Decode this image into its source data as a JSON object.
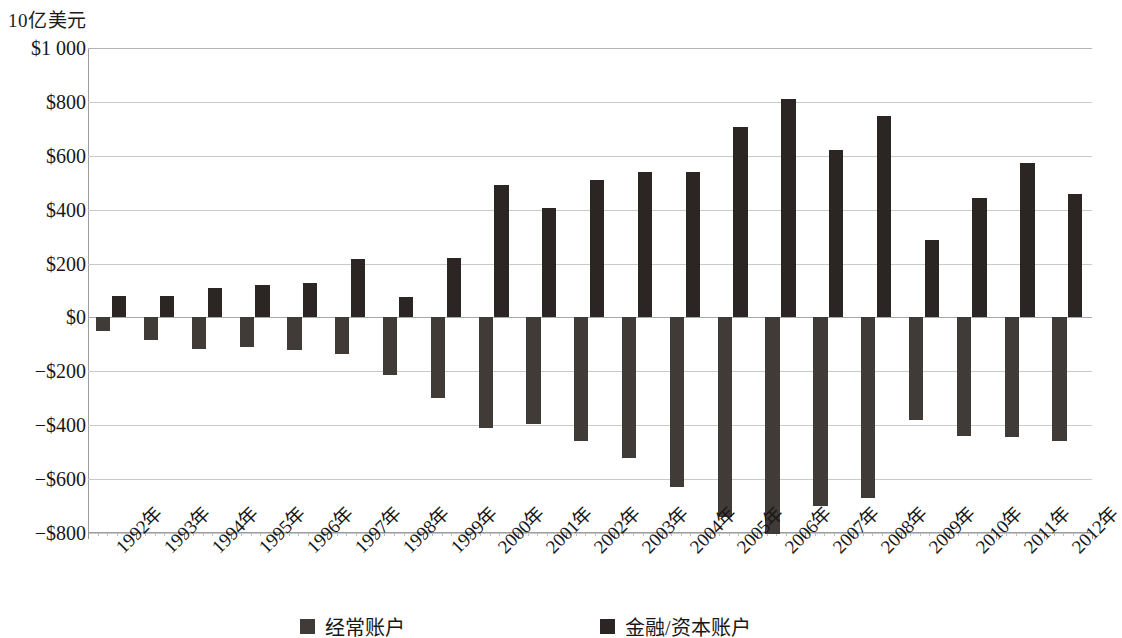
{
  "unit_caption": "10亿美元",
  "legend": {
    "position": "bottom",
    "entries": [
      {
        "label": "经常账户",
        "color": "#413b37",
        "key": "ca"
      },
      {
        "label": "金融/资本账户",
        "color": "#2b2623",
        "key": "fa"
      }
    ]
  },
  "axis": {
    "y_tick_labels": [
      "$1 000",
      "$800",
      "$600",
      "$400",
      "$200",
      "$0",
      "−$200",
      "−$400",
      "−$600",
      "−$800"
    ],
    "y_tick_values": [
      1000,
      800,
      600,
      400,
      200,
      0,
      -200,
      -400,
      -600,
      -800
    ]
  },
  "chart_data": {
    "type": "bar",
    "title": "",
    "subtitle": "",
    "xlabel": "",
    "ylabel": "10亿美元",
    "ylim": [
      -800,
      1000
    ],
    "ytick_step": 200,
    "grid": true,
    "legend_position": "bottom",
    "categories": [
      "1992年",
      "1993年",
      "1994年",
      "1995年",
      "1996年",
      "1997年",
      "1998年",
      "1999年",
      "2000年",
      "2001年",
      "2002年",
      "2003年",
      "2004年",
      "2005年",
      "2006年",
      "2007年",
      "2008年",
      "2009年",
      "2010年",
      "2011年",
      "2012年"
    ],
    "series": [
      {
        "name": "经常账户",
        "color": "#413b37",
        "values": [
          -50,
          -82,
          -118,
          -110,
          -120,
          -136,
          -215,
          -300,
          -410,
          -395,
          -460,
          -520,
          -630,
          -740,
          -805,
          -700,
          -670,
          -380,
          -440,
          -445,
          -460
        ]
      },
      {
        "name": "金融/资本账户",
        "color": "#2b2623",
        "values": [
          80,
          78,
          110,
          120,
          128,
          218,
          75,
          222,
          490,
          405,
          510,
          540,
          540,
          705,
          812,
          622,
          748,
          288,
          445,
          572,
          458
        ]
      }
    ]
  }
}
